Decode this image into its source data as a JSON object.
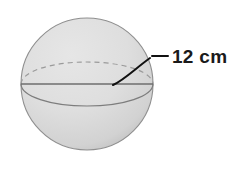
{
  "figure": {
    "name": "sphere-diagram",
    "shape": "sphere",
    "background_color": "#ffffff",
    "fill_color": "#dcdcdc",
    "outline_color": "#8c8c8c",
    "line_color": "#6e6e6e",
    "label_color": "#1a1a1a",
    "labels": {
      "measure": "12 cm"
    },
    "geometry": {
      "center_x": 87,
      "center_y": 84,
      "radius": 66,
      "equator_rx": 66,
      "equator_ry": 22
    },
    "annotations": {
      "leader_kind": "curved-pointer-with-dash",
      "measure_target": "radius"
    }
  }
}
